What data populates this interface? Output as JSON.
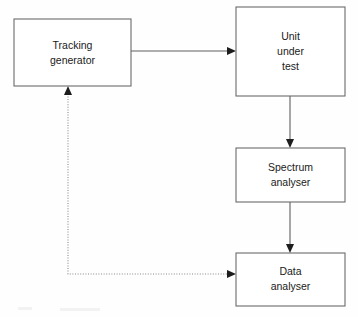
{
  "diagram": {
    "type": "block-diagram",
    "canvas": {
      "width": 358,
      "height": 317
    },
    "colors": {
      "background": "#fefefe",
      "box_fill": "#ffffff",
      "box_stroke": "#6b6b6b",
      "solid_edge": "#5e5e5e",
      "dotted_edge": "#8a8a8a",
      "arrow_head": "#1d1d1d",
      "text": "#1a1a1a"
    },
    "nodes": [
      {
        "id": "tracking-generator",
        "label": "Tracking generator",
        "lines": [
          "Tracking",
          "generator"
        ],
        "x": 14,
        "y": 19,
        "width": 117,
        "height": 67
      },
      {
        "id": "unit-under-test",
        "label": "Unit under test",
        "lines": [
          "Unit",
          "under",
          "test"
        ],
        "x": 236,
        "y": 7,
        "width": 109,
        "height": 89
      },
      {
        "id": "spectrum-analyser",
        "label": "Spectrum analyser",
        "lines": [
          "Spectrum",
          "analyser"
        ],
        "x": 236,
        "y": 148,
        "width": 109,
        "height": 54
      },
      {
        "id": "data-analyser",
        "label": "Data analyser",
        "lines": [
          "Data",
          "analyser"
        ],
        "x": 236,
        "y": 253,
        "width": 109,
        "height": 53
      }
    ],
    "edges": [
      {
        "id": "edge-tracking-to-unit",
        "from": "tracking-generator",
        "to": "unit-under-test",
        "style": "solid",
        "direction": "right",
        "arrow": true
      },
      {
        "id": "edge-unit-to-spectrum",
        "from": "unit-under-test",
        "to": "spectrum-analyser",
        "style": "solid",
        "direction": "down",
        "arrow": true
      },
      {
        "id": "edge-spectrum-to-data",
        "from": "spectrum-analyser",
        "to": "data-analyser",
        "style": "solid",
        "direction": "down",
        "arrow": true
      },
      {
        "id": "edge-data-to-tracking-feedback",
        "from": "data-analyser",
        "to": "tracking-generator",
        "style": "dotted",
        "direction": "up",
        "arrow": true
      }
    ]
  }
}
